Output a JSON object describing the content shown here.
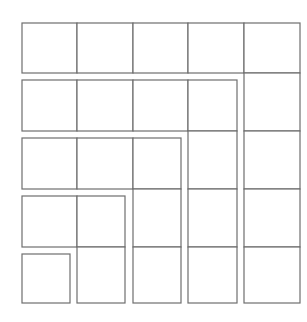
{
  "diagram": {
    "title": "",
    "stroke_color": "#6e6e6e",
    "background": "#ffffff",
    "gnomons": [
      {
        "id": 1,
        "squares": 1,
        "cells": [
          [
            22,
            254,
            48,
            49
          ]
        ]
      },
      {
        "id": 2,
        "squares": 3,
        "cells": [
          [
            22,
            196,
            55,
            51
          ],
          [
            77,
            196,
            48,
            51
          ],
          [
            77,
            247,
            48,
            56
          ]
        ]
      },
      {
        "id": 3,
        "squares": 5,
        "cells": [
          [
            22,
            138,
            55,
            51
          ],
          [
            77,
            138,
            56,
            51
          ],
          [
            133,
            138,
            48,
            51
          ],
          [
            133,
            189,
            48,
            58
          ],
          [
            133,
            247,
            48,
            56
          ]
        ]
      },
      {
        "id": 4,
        "squares": 7,
        "cells": [
          [
            22,
            80,
            55,
            51
          ],
          [
            77,
            80,
            56,
            51
          ],
          [
            133,
            80,
            55,
            51
          ],
          [
            188,
            80,
            49,
            51
          ],
          [
            188,
            131,
            49,
            58
          ],
          [
            188,
            189,
            49,
            58
          ],
          [
            188,
            247,
            49,
            56
          ]
        ]
      },
      {
        "id": 5,
        "squares": 9,
        "cells": [
          [
            22,
            23,
            55,
            50
          ],
          [
            77,
            23,
            56,
            50
          ],
          [
            133,
            23,
            55,
            50
          ],
          [
            188,
            23,
            56,
            50
          ],
          [
            244,
            23,
            56,
            50
          ],
          [
            244,
            73,
            56,
            58
          ],
          [
            244,
            131,
            56,
            58
          ],
          [
            244,
            189,
            56,
            58
          ],
          [
            244,
            247,
            56,
            56
          ]
        ]
      }
    ]
  }
}
